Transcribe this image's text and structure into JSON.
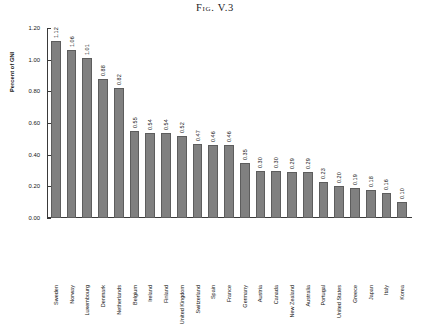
{
  "figure": {
    "title": "Fig. V.3"
  },
  "chart_data": {
    "type": "bar",
    "title": "Fig. V.3",
    "xlabel": "",
    "ylabel": "Percent of GNI",
    "ylim": [
      0.0,
      1.2
    ],
    "ytick_labels": [
      "1.20",
      "1.00",
      "0.80",
      "0.60",
      "0.40",
      "0.20",
      "0.00"
    ],
    "ytick_values": [
      1.2,
      1.0,
      0.8,
      0.6,
      0.4,
      0.2,
      0.0
    ],
    "grid": false,
    "legend": null,
    "bar_color": "#808080",
    "categories": [
      "Sweden",
      "Norway",
      "Luxembourg",
      "Denmark",
      "Netherlands",
      "Belgium",
      "Ireland",
      "Finland",
      "United Kingdom",
      "Switzerland",
      "Spain",
      "France",
      "Germany",
      "Austria",
      "Canada",
      "New Zealand",
      "Australia",
      "Portugal",
      "United States",
      "Greece",
      "Japan",
      "Italy",
      "Korea"
    ],
    "values": [
      1.12,
      1.06,
      1.01,
      0.88,
      0.82,
      0.55,
      0.54,
      0.54,
      0.52,
      0.47,
      0.46,
      0.46,
      0.35,
      0.3,
      0.3,
      0.29,
      0.29,
      0.23,
      0.2,
      0.19,
      0.18,
      0.16,
      0.1
    ],
    "value_labels": [
      "1.12",
      "1.06",
      "1.01",
      "0.88",
      "0.82",
      "0.55",
      "0.54",
      "0.54",
      "0.52",
      "0.47",
      "0.46",
      "0.46",
      "0.35",
      "0.30",
      "0.30",
      "0.29",
      "0.29",
      "0.23",
      "0.20",
      "0.19",
      "0.18",
      "0.16",
      "0.10"
    ]
  }
}
